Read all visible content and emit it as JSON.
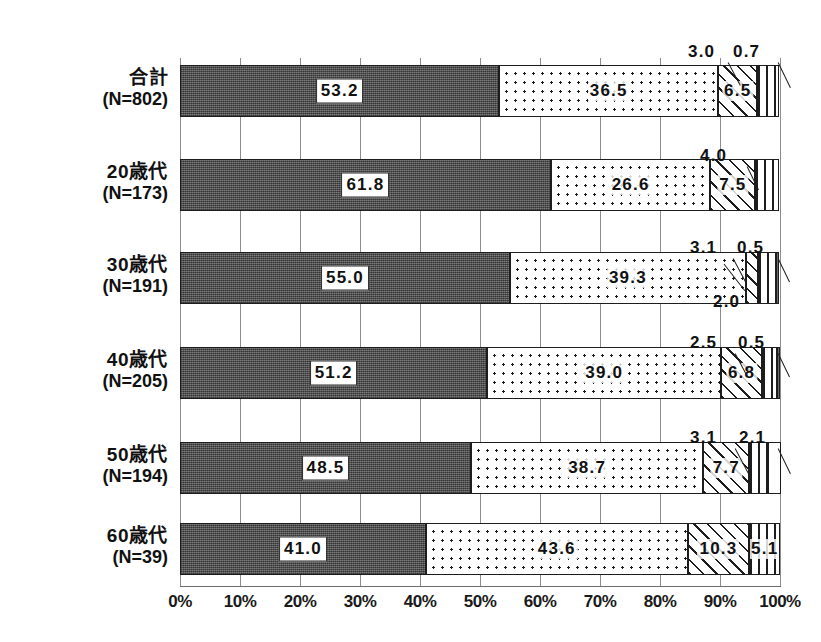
{
  "chart_data": {
    "type": "bar",
    "orientation": "horizontal",
    "stacked": true,
    "normalized_percent": true,
    "title": "",
    "subtitle": "",
    "xlabel": "",
    "ylabel": "",
    "xlim": [
      0,
      100
    ],
    "grid": true,
    "legend_position": "bottom",
    "categories": [
      "合計\n(N=802)",
      "20歳代\n(N=173)",
      "30歳代\n(N=191)",
      "40歳代\n(N=205)",
      "50歳代\n(N=194)",
      "60歳代\n(N=39)"
    ],
    "xtick_labels": [
      "0%",
      "10%",
      "20%",
      "30%",
      "40%",
      "50%",
      "60%",
      "70%",
      "80%",
      "90%",
      "100%"
    ],
    "xtick_values": [
      0,
      10,
      20,
      30,
      40,
      50,
      60,
      70,
      80,
      90,
      100
    ],
    "series": [
      {
        "name": "series-1",
        "pattern": "solid-dark",
        "values": [
          53.2,
          61.8,
          55.0,
          51.2,
          48.5,
          41.0
        ]
      },
      {
        "name": "series-2",
        "pattern": "dotted",
        "values": [
          36.5,
          26.6,
          39.3,
          39.0,
          38.7,
          43.6
        ]
      },
      {
        "name": "series-3",
        "pattern": "hatched",
        "values": [
          6.5,
          7.5,
          2.0,
          6.8,
          7.7,
          10.3
        ]
      },
      {
        "name": "series-4",
        "pattern": "vertical",
        "values": [
          3.0,
          4.0,
          3.1,
          2.5,
          3.1,
          5.1
        ]
      },
      {
        "name": "series-5",
        "pattern": "blank",
        "values": [
          0.7,
          0.0,
          0.5,
          0.5,
          2.1,
          0.0
        ]
      }
    ]
  },
  "rows": [
    {
      "name": "合計",
      "n": "(N=802)",
      "segments": [
        {
          "value": "53.2",
          "label_style": "boxed",
          "pattern": "p-solid"
        },
        {
          "value": "36.5",
          "label_style": "plain",
          "pattern": "p-dots"
        },
        {
          "value": "6.5",
          "label_style": "plain",
          "pattern": "p-hatch"
        },
        {
          "value": "3.0",
          "label_style": "callout",
          "pattern": "p-vert"
        },
        {
          "value": "0.7",
          "label_style": "callout",
          "pattern": "p-blank"
        }
      ]
    },
    {
      "name": "20歳代",
      "n": "(N=173)",
      "segments": [
        {
          "value": "61.8",
          "label_style": "boxed",
          "pattern": "p-solid"
        },
        {
          "value": "26.6",
          "label_style": "plain",
          "pattern": "p-dots"
        },
        {
          "value": "7.5",
          "label_style": "plain",
          "pattern": "p-hatch"
        },
        {
          "value": "4.0",
          "label_style": "callout",
          "pattern": "p-vert"
        }
      ]
    },
    {
      "name": "30歳代",
      "n": "(N=191)",
      "segments": [
        {
          "value": "55.0",
          "label_style": "boxed",
          "pattern": "p-solid"
        },
        {
          "value": "39.3",
          "label_style": "plain",
          "pattern": "p-dots"
        },
        {
          "value": "2.0",
          "label_style": "callout",
          "pattern": "p-hatch"
        },
        {
          "value": "3.1",
          "label_style": "callout",
          "pattern": "p-vert"
        },
        {
          "value": "0.5",
          "label_style": "callout",
          "pattern": "p-dark"
        }
      ]
    },
    {
      "name": "40歳代",
      "n": "(N=205)",
      "segments": [
        {
          "value": "51.2",
          "label_style": "boxed",
          "pattern": "p-solid"
        },
        {
          "value": "39.0",
          "label_style": "plain",
          "pattern": "p-dots"
        },
        {
          "value": "6.8",
          "label_style": "plain",
          "pattern": "p-hatch"
        },
        {
          "value": "2.5",
          "label_style": "callout",
          "pattern": "p-vert"
        },
        {
          "value": "0.5",
          "label_style": "callout",
          "pattern": "p-dark"
        }
      ]
    },
    {
      "name": "50歳代",
      "n": "(N=194)",
      "segments": [
        {
          "value": "48.5",
          "label_style": "boxed",
          "pattern": "p-solid"
        },
        {
          "value": "38.7",
          "label_style": "plain",
          "pattern": "p-dots"
        },
        {
          "value": "7.7",
          "label_style": "plain",
          "pattern": "p-hatch"
        },
        {
          "value": "3.1",
          "label_style": "callout",
          "pattern": "p-vert"
        },
        {
          "value": "2.1",
          "label_style": "callout",
          "pattern": "p-blank"
        }
      ]
    },
    {
      "name": "60歳代",
      "n": "(N=39)",
      "segments": [
        {
          "value": "41.0",
          "label_style": "boxed",
          "pattern": "p-solid"
        },
        {
          "value": "43.6",
          "label_style": "plain",
          "pattern": "p-dots"
        },
        {
          "value": "10.3",
          "label_style": "plain",
          "pattern": "p-hatch"
        },
        {
          "value": "5.1",
          "label_style": "plain",
          "pattern": "p-vert"
        }
      ]
    }
  ],
  "callouts": [
    {
      "id": "c1",
      "text": "3.0",
      "x": 688,
      "y": 42,
      "lx": 728,
      "ly": 62,
      "len": 26,
      "ang": 62
    },
    {
      "id": "c2",
      "text": "0.7",
      "x": 733,
      "y": 42,
      "lx": 778,
      "ly": 62,
      "len": 28,
      "ang": 64
    },
    {
      "id": "c3",
      "text": "4.0",
      "x": 700,
      "y": 146,
      "lx": 747,
      "ly": 166,
      "len": 26,
      "ang": 64
    },
    {
      "id": "c4",
      "text": "3.1",
      "x": 690,
      "y": 238,
      "lx": 733,
      "ly": 258,
      "len": 26,
      "ang": 62
    },
    {
      "id": "c5",
      "text": "0.5",
      "x": 737,
      "y": 238,
      "lx": 778,
      "ly": 258,
      "len": 26,
      "ang": 64
    },
    {
      "id": "c6",
      "text": "2.0",
      "x": 713,
      "y": 292,
      "lx": 745,
      "ly": 290,
      "len": 34,
      "ang": -128
    },
    {
      "id": "c7",
      "text": "2.5",
      "x": 690,
      "y": 333,
      "lx": 735,
      "ly": 353,
      "len": 26,
      "ang": 62
    },
    {
      "id": "c8",
      "text": "0.5",
      "x": 738,
      "y": 333,
      "lx": 778,
      "ly": 353,
      "len": 26,
      "ang": 64
    },
    {
      "id": "c9",
      "text": "3.1",
      "x": 690,
      "y": 428,
      "lx": 735,
      "ly": 448,
      "len": 28,
      "ang": 62
    },
    {
      "id": "c10",
      "text": "2.1",
      "x": 739,
      "y": 428,
      "lx": 778,
      "ly": 448,
      "len": 28,
      "ang": 64
    }
  ],
  "ticks": [
    {
      "label": "0%",
      "value": 0
    },
    {
      "label": "10%",
      "value": 10
    },
    {
      "label": "20%",
      "value": 20
    },
    {
      "label": "30%",
      "value": 30
    },
    {
      "label": "40%",
      "value": 40
    },
    {
      "label": "50%",
      "value": 50
    },
    {
      "label": "60%",
      "value": 60
    },
    {
      "label": "70%",
      "value": 70
    },
    {
      "label": "80%",
      "value": 80
    },
    {
      "label": "90%",
      "value": 90
    },
    {
      "label": "100%",
      "value": 100
    }
  ]
}
